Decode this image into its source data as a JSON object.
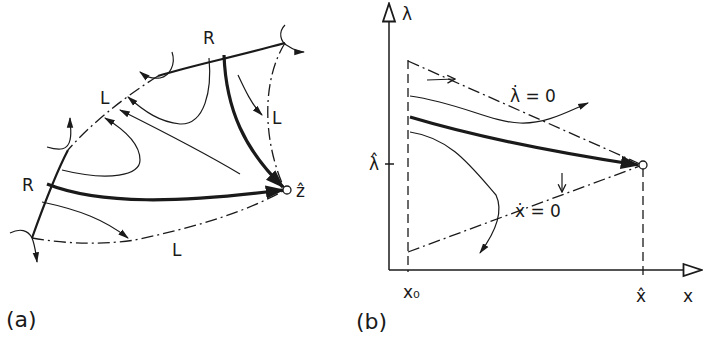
{
  "panel_a": {
    "label": "(a)",
    "boundary_labels": {
      "top_R": "R",
      "left_R": "R",
      "upper_L": "L",
      "right_L": "L",
      "bottom_L": "L"
    },
    "equilibrium_label": "ẑ"
  },
  "panel_b": {
    "label": "(b)",
    "y_axis_label": "λ",
    "x_axis_label": "x",
    "y_tick_label": "λ̂",
    "x_tick_labels": [
      "x₀",
      "x̂"
    ],
    "isocline_lambda": "λ̇ = 0",
    "isocline_x": "ẋ = 0"
  },
  "colors": {
    "ink": "#1a1a1a",
    "background": "#ffffff"
  }
}
